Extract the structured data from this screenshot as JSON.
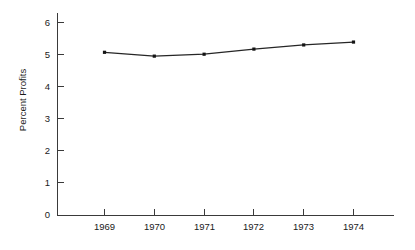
{
  "chart_data": {
    "type": "line",
    "title": "",
    "xlabel": "",
    "ylabel": "Percent Profits",
    "categories": [
      "1969",
      "1970",
      "1971",
      "1972",
      "1973",
      "1974"
    ],
    "x": [
      1969,
      1970,
      1971,
      1972,
      1973,
      1974
    ],
    "values": [
      5.1,
      4.98,
      5.04,
      5.2,
      5.33,
      5.42
    ],
    "series": [
      {
        "name": "Percent Profits",
        "values": [
          5.1,
          4.98,
          5.04,
          5.2,
          5.33,
          5.42
        ]
      }
    ],
    "ylim": [
      0,
      6
    ],
    "yticks": [
      0,
      1,
      2,
      3,
      4,
      5,
      6
    ],
    "ytick_labels": [
      "0",
      "1",
      "2",
      "3",
      "4",
      "5",
      "6"
    ],
    "xtick_labels": [
      "1969",
      "1970",
      "1971",
      "1972",
      "1973",
      "1974"
    ],
    "grid": false,
    "legend": false,
    "legend_position": "none",
    "marker": "square",
    "line_color": "#262626",
    "axis_color": "#3a3a3a",
    "background_color": "#ffffff",
    "tick_direction": "in"
  }
}
